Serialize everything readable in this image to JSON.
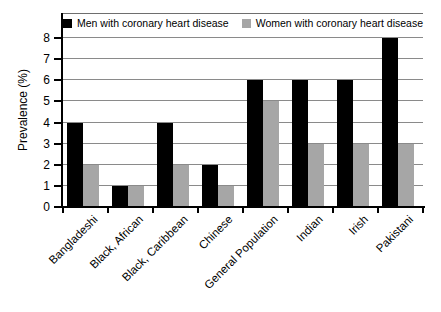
{
  "figure": {
    "background": "#ffffff"
  },
  "chart_data": {
    "type": "bar",
    "title": "",
    "xlabel": "",
    "ylabel": "Prevalence (%)",
    "ylim": [
      0,
      8
    ],
    "yticks": [
      0,
      1,
      2,
      3,
      4,
      5,
      6,
      7,
      8
    ],
    "grid": true,
    "legend_position": "top-inside",
    "categories": [
      "Bangladeshi",
      "Black, African",
      "Black, Caribbean",
      "Chinese",
      "General Population",
      "Indian",
      "Irish",
      "Pakistani"
    ],
    "series": [
      {
        "name": "Men with coronary heart disease",
        "color": "#000000",
        "values": [
          4,
          1,
          4,
          2,
          6,
          6,
          6,
          8
        ]
      },
      {
        "name": "Women with coronary heart disease",
        "color": "#a6a6a6",
        "values": [
          2,
          1,
          2,
          1,
          5,
          3,
          3,
          3
        ]
      }
    ],
    "colors": {
      "axis": "#000000",
      "gridline": "#8a8a8a",
      "plot_top_border": "#6e6e6e",
      "text": "#000000"
    }
  }
}
